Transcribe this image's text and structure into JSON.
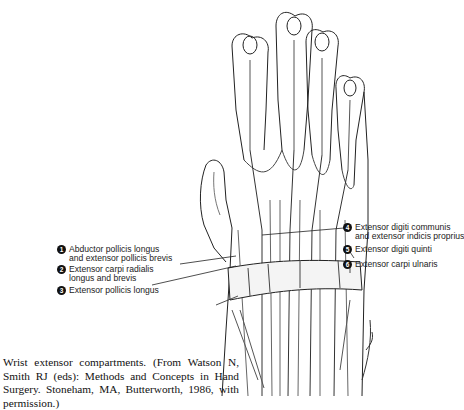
{
  "figure": {
    "title": "Wrist extensor compartments",
    "illustration": "dorsal-hand-wrist-extensor-anatomy-drawing",
    "labels": [
      {
        "number": "1",
        "line1": "Abductor pollicis longus",
        "line2": "and extensor pollicis brevis"
      },
      {
        "number": "2",
        "line1": "Extensor carpi radialis",
        "line2": "longus and brevis"
      },
      {
        "number": "3",
        "line1": "Extensor pollicis longus",
        "line2": ""
      },
      {
        "number": "4",
        "line1": "Extensor digiti communis",
        "line2": "and extensor indicis proprius"
      },
      {
        "number": "5",
        "line1": "Extensor digiti quinti",
        "line2": ""
      },
      {
        "number": "6",
        "line1": "Extensor carpi ulnaris",
        "line2": ""
      }
    ],
    "signature": "illustrator-signature",
    "caption": "Wrist extensor compartments. (From Watson N, Smith RJ (eds): Methods and Concepts in Hand Surgery. Stoneham, MA, Butterworth, 1986, with permission.)"
  }
}
